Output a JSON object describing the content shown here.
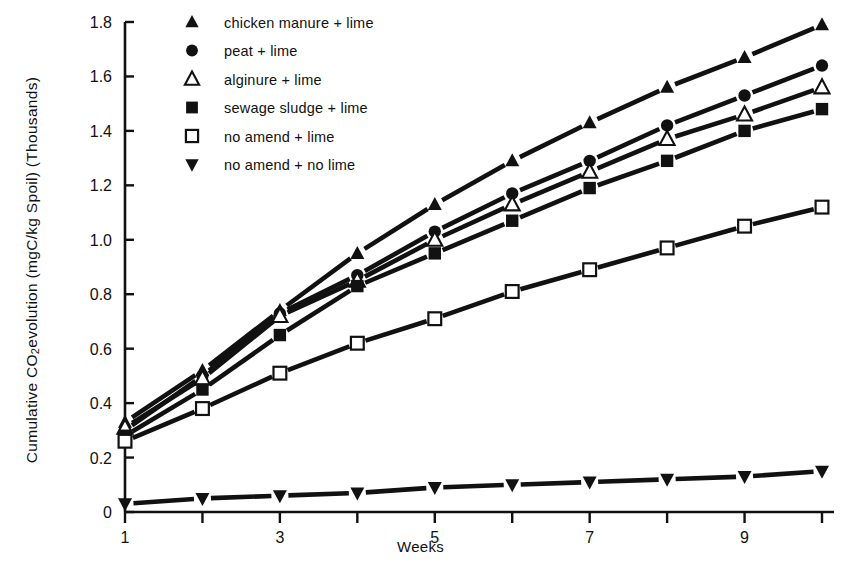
{
  "chart_data": {
    "type": "line",
    "title": "",
    "xlabel": "Weeks",
    "ylabel": "Cumulative CO2 evolution  (mgC/kg Spoil) (Thousands)",
    "ylabel_parts": {
      "pre": "Cumulative CO",
      "sub": "2",
      "post": " evolution  (mgC/kg Spoil) (Thousands)"
    },
    "x": [
      1,
      2,
      3,
      4,
      5,
      6,
      7,
      8,
      9,
      10
    ],
    "xlim": [
      1,
      10
    ],
    "ylim": [
      0,
      1.8
    ],
    "xticks": [
      1,
      2,
      3,
      4,
      5,
      6,
      7,
      8,
      9,
      10
    ],
    "xticklabels": [
      "1",
      "",
      "3",
      "",
      "5",
      "",
      "7",
      "",
      "9",
      ""
    ],
    "yticks": [
      0,
      0.2,
      0.4,
      0.6,
      0.8,
      1.0,
      1.2,
      1.4,
      1.6,
      1.8
    ],
    "yticklabels": [
      "0",
      "0.2",
      "0.4",
      "0.6",
      "0.8",
      "1.0",
      "1.2",
      "1.4",
      "1.6",
      "1.8"
    ],
    "grid": false,
    "legend_position": "upper-left-inside",
    "series": [
      {
        "name": "chicken manure + lime",
        "marker": "filled-triangle-up",
        "values": [
          0.33,
          0.52,
          0.74,
          0.95,
          1.13,
          1.29,
          1.43,
          1.56,
          1.67,
          1.79
        ]
      },
      {
        "name": "peat + lime",
        "marker": "filled-circle",
        "values": [
          0.3,
          0.5,
          0.73,
          0.87,
          1.03,
          1.17,
          1.29,
          1.42,
          1.53,
          1.64
        ]
      },
      {
        "name": "alginure + lime",
        "marker": "open-triangle-up",
        "values": [
          0.31,
          0.49,
          0.72,
          0.85,
          1.0,
          1.13,
          1.25,
          1.37,
          1.46,
          1.56
        ]
      },
      {
        "name": "sewage sludge + lime",
        "marker": "filled-square",
        "values": [
          0.28,
          0.45,
          0.65,
          0.83,
          0.95,
          1.07,
          1.19,
          1.29,
          1.4,
          1.48
        ]
      },
      {
        "name": "no amend + lime",
        "marker": "open-square",
        "values": [
          0.26,
          0.38,
          0.51,
          0.62,
          0.71,
          0.81,
          0.89,
          0.97,
          1.05,
          1.12
        ]
      },
      {
        "name": "no amend + no lime",
        "marker": "filled-triangle-down",
        "values": [
          0.03,
          0.05,
          0.06,
          0.07,
          0.09,
          0.1,
          0.11,
          0.12,
          0.13,
          0.15
        ]
      }
    ]
  },
  "legend": {
    "items": [
      {
        "label": "chicken manure + lime",
        "marker": "filled-triangle-up"
      },
      {
        "label": "peat + lime",
        "marker": "filled-circle"
      },
      {
        "label": "alginure + lime",
        "marker": "open-triangle-up"
      },
      {
        "label": "sewage sludge + lime",
        "marker": "filled-square"
      },
      {
        "label": "no amend + lime",
        "marker": "open-square"
      },
      {
        "label": "no amend + no lime",
        "marker": "filled-triangle-down"
      }
    ]
  },
  "colors": {
    "ink": "#111111",
    "background": "#ffffff"
  }
}
